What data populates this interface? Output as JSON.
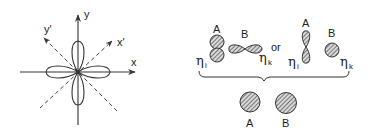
{
  "left_panel": {
    "axes": {
      "x_label": "x",
      "y_label": "y",
      "x_prime_label": "x'",
      "y_prime_label": "y'"
    },
    "description": "four-lobed d-orbital with rotated dashed axes at 45 degrees"
  },
  "right_panel": {
    "top_left_group": {
      "atom_a_label": "A",
      "atom_b_label": "B",
      "eta_i_symbol": "η",
      "eta_i_sub": "i",
      "eta_k_symbol": "η",
      "eta_k_sub": "k"
    },
    "or_text": "or",
    "top_right_group": {
      "atom_a_label": "A",
      "atom_b_label": "B",
      "eta_i_symbol": "η",
      "eta_i_sub": "i",
      "eta_k_symbol": "η",
      "eta_k_sub": "k"
    },
    "bottom_group": {
      "atom_a_label": "A",
      "atom_b_label": "B"
    }
  },
  "colors": {
    "stroke": "#333333",
    "hatch": "#555555",
    "background": "#ffffff"
  }
}
